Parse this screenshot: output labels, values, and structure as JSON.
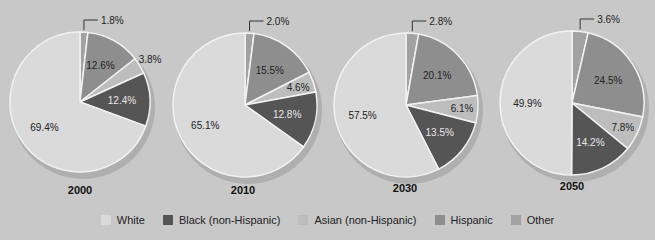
{
  "chart_data": {
    "type": "pie",
    "title": "",
    "categories": [
      "White",
      "Black (non-Hispanic)",
      "Asian (non-Hispanic)",
      "Hispanic",
      "Other"
    ],
    "colors": {
      "White": "#dadada",
      "Black (non-Hispanic)": "#555555",
      "Asian (non-Hispanic)": "#bdbdbd",
      "Hispanic": "#8e8e8e",
      "Other": "#a2a2a2"
    },
    "pies": [
      {
        "year": "2000",
        "values": {
          "White": 69.4,
          "Black (non-Hispanic)": 12.4,
          "Asian (non-Hispanic)": 3.8,
          "Hispanic": 12.6,
          "Other": 1.8
        }
      },
      {
        "year": "2010",
        "values": {
          "White": 65.1,
          "Black (non-Hispanic)": 12.8,
          "Asian (non-Hispanic)": 4.6,
          "Hispanic": 15.5,
          "Other": 2.0
        }
      },
      {
        "year": "2030",
        "values": {
          "White": 57.5,
          "Black (non-Hispanic)": 13.5,
          "Asian (non-Hispanic)": 6.1,
          "Hispanic": 20.1,
          "Other": 2.8
        }
      },
      {
        "year": "2050",
        "values": {
          "White": 49.9,
          "Black (non-Hispanic)": 14.2,
          "Asian (non-Hispanic)": 7.8,
          "Hispanic": 24.5,
          "Other": 3.6
        }
      }
    ],
    "legend_position": "bottom"
  },
  "labels": {
    "years": [
      "2000",
      "2010",
      "2030",
      "2050"
    ],
    "legend": [
      "White",
      "Black (non-Hispanic)",
      "Asian (non-Hispanic)",
      "Hispanic",
      "Other"
    ]
  }
}
